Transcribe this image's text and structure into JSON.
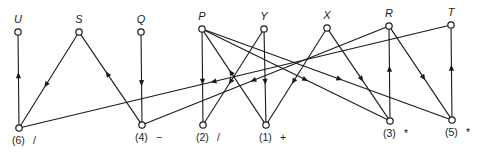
{
  "diagram": {
    "type": "directed-graph",
    "top_nodes": [
      {
        "id": "U",
        "label": "U",
        "x": 18,
        "y": 32
      },
      {
        "id": "S",
        "label": "S",
        "x": 79,
        "y": 32
      },
      {
        "id": "Q",
        "label": "Q",
        "x": 141,
        "y": 32
      },
      {
        "id": "P",
        "label": "P",
        "x": 202,
        "y": 29
      },
      {
        "id": "Y",
        "label": "Y",
        "x": 264,
        "y": 29
      },
      {
        "id": "X",
        "label": "X",
        "x": 327,
        "y": 28
      },
      {
        "id": "R",
        "label": "R",
        "x": 389,
        "y": 26
      },
      {
        "id": "T",
        "label": "T",
        "x": 451,
        "y": 25
      }
    ],
    "bottom_nodes": [
      {
        "id": "n6",
        "label": "(6)",
        "op": "/",
        "x": 19,
        "y": 128
      },
      {
        "id": "n4",
        "label": "(4)",
        "op": "−",
        "x": 142,
        "y": 125
      },
      {
        "id": "n2",
        "label": "(2)",
        "op": "/",
        "x": 203,
        "y": 125
      },
      {
        "id": "n1",
        "label": "(1)",
        "op": "+",
        "x": 266,
        "y": 125
      },
      {
        "id": "n3",
        "label": "(3)",
        "op": "*",
        "x": 390,
        "y": 121
      },
      {
        "id": "n5",
        "label": "(5)",
        "op": "*",
        "x": 452,
        "y": 120
      }
    ],
    "edges": [
      {
        "from": "n6",
        "to": "U"
      },
      {
        "from": "S",
        "to": "n6"
      },
      {
        "from": "n4",
        "to": "S"
      },
      {
        "from": "Q",
        "to": "n4"
      },
      {
        "from": "T",
        "to": "n6"
      },
      {
        "from": "R",
        "to": "n4"
      },
      {
        "from": "P",
        "to": "n2"
      },
      {
        "from": "Y",
        "to": "n2"
      },
      {
        "from": "n1",
        "to": "P"
      },
      {
        "from": "Y",
        "to": "n1"
      },
      {
        "from": "X",
        "to": "n1"
      },
      {
        "from": "X",
        "to": "n3"
      },
      {
        "from": "P",
        "to": "n3"
      },
      {
        "from": "n3",
        "to": "R"
      },
      {
        "from": "R",
        "to": "n5"
      },
      {
        "from": "P",
        "to": "n5"
      },
      {
        "from": "n5",
        "to": "T"
      }
    ]
  }
}
